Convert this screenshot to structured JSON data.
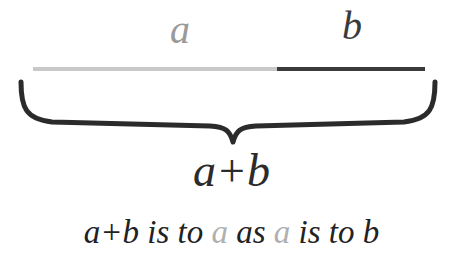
{
  "figure": {
    "background_color": "#ffffff"
  },
  "segment": {
    "labels": {
      "a": "a",
      "b": "b"
    },
    "colors": {
      "a": "#c9c9c9",
      "b": "#3a3a3a",
      "a_text": "#9a9a9a",
      "b_text": "#3a3a3a",
      "brace": "#2b2b2b",
      "sum_text": "#2b2b2b",
      "caption_text": "#222222",
      "caption_gray": "#b0b0b0"
    },
    "a_fraction_percent": "62.2",
    "b_fraction_percent": "37.8"
  },
  "brace": {
    "name": "underbrace",
    "direction": "down"
  },
  "sum": {
    "label": "a+b"
  },
  "caption": {
    "full_text": "a+b is to a as a is to b",
    "part_1": "a+b is to ",
    "part_2_gray": "a",
    "part_3": " as ",
    "part_4_gray": "a",
    "part_5": " is to b"
  }
}
